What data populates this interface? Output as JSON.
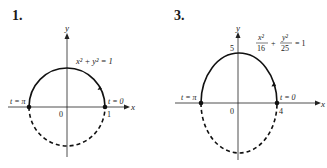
{
  "figures": [
    {
      "number": "1.",
      "equation": "x² + y² = 1",
      "axes": {
        "x_label": "x",
        "y_label": "y",
        "origin_label": "0"
      },
      "tick_labels": {
        "x_right": "1"
      },
      "points": {
        "start": "t = 0",
        "end": "t = π"
      },
      "curve": {
        "type": "circle",
        "a": 1,
        "b": 1,
        "solid_half": "upper",
        "dashed_half": "lower",
        "direction": "counterclockwise"
      }
    },
    {
      "number": "3.",
      "equation": {
        "term1_num": "x²",
        "term1_den": "16",
        "plus": "+",
        "term2_num": "y²",
        "term2_den": "25",
        "rhs": "= 1"
      },
      "axes": {
        "x_label": "x",
        "y_label": "y",
        "origin_label": "0"
      },
      "tick_labels": {
        "x_right": "4",
        "y_top": "5"
      },
      "points": {
        "start": "t = 0",
        "end": "t = π"
      },
      "curve": {
        "type": "ellipse",
        "a": 4,
        "b": 5,
        "solid_half": "upper",
        "dashed_half": "lower",
        "direction": "counterclockwise"
      }
    }
  ]
}
